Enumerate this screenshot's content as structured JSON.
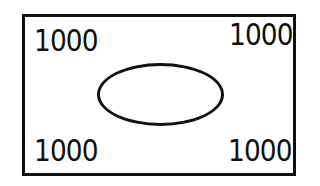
{
  "diagram": {
    "corners": {
      "top_left": "1000",
      "top_right": "1000",
      "bottom_left": "1000",
      "bottom_right": "1000"
    },
    "center_shape": "ellipse",
    "colors": {
      "stroke": "#111111",
      "background": "#ffffff"
    }
  }
}
